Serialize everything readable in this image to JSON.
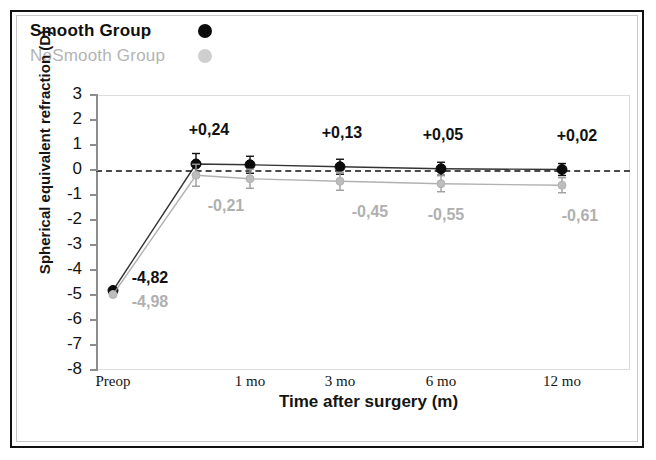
{
  "figure": {
    "legend": {
      "position": "top-left",
      "entries": [
        {
          "label": "Smooth Group",
          "marker": "filled-circle",
          "color": "#0b0b0b",
          "text_color": "#101010"
        },
        {
          "label": "NoSmooth Group",
          "marker": "filled-circle",
          "color": "#cecece",
          "text_color": "#b4b4b4"
        }
      ]
    }
  },
  "chart_data": {
    "type": "line",
    "title": "",
    "xlabel": "Time after surgery (m)",
    "ylabel": "Spherical equivalent refraction (D)",
    "categories": [
      "Preop",
      "",
      "1 mo",
      "3 mo",
      "6 mo",
      "12 mo"
    ],
    "tick_labels_x": [
      "Preop",
      "1 mo",
      "3 mo",
      "6 mo",
      "12 mo"
    ],
    "ylim": [
      -8,
      3
    ],
    "yticks": [
      3,
      2,
      1,
      0,
      -1,
      -2,
      -3,
      -4,
      -5,
      -6,
      -7,
      -8
    ],
    "ytick_labels": [
      "3",
      "2",
      "1",
      "0",
      "-1",
      "-2",
      "-3",
      "-4",
      "-5",
      "-6",
      "-7",
      "-8"
    ],
    "grid": false,
    "legend_position": "above-plot-left",
    "reference_line": {
      "y": 0,
      "style": "dashed",
      "color": "#4a4a4a"
    },
    "series": [
      {
        "name": "Smooth Group",
        "color": "#111111",
        "marker": "filled-circle",
        "values": [
          -4.82,
          0.24,
          0.21,
          0.13,
          0.05,
          0.02
        ],
        "errors": [
          0.0,
          0.42,
          0.34,
          0.3,
          0.26,
          0.24
        ],
        "point_labels": [
          "-4,82",
          "+0,24",
          "",
          "+0,13",
          "+0,05",
          "+0,02"
        ]
      },
      {
        "name": "NoSmooth Group",
        "color": "#9e9e9e",
        "marker": "filled-circle",
        "values": [
          -4.98,
          -0.21,
          -0.35,
          -0.45,
          -0.55,
          -0.61
        ],
        "errors": [
          0.0,
          0.44,
          0.38,
          0.36,
          0.32,
          0.3
        ],
        "point_labels": [
          "-4,98",
          "-0,21",
          "",
          "-0,45",
          "-0,55",
          "-0,61"
        ]
      }
    ],
    "annotations": [
      {
        "text": "+0,24",
        "series": "Smooth Group",
        "x_index": 1,
        "color": "#111111"
      },
      {
        "text": "+0,13",
        "series": "Smooth Group",
        "x_index": 3,
        "color": "#111111"
      },
      {
        "text": "+0,05",
        "series": "Smooth Group",
        "x_index": 4,
        "color": "#111111"
      },
      {
        "text": "+0,02",
        "series": "Smooth Group",
        "x_index": 5,
        "color": "#111111"
      },
      {
        "text": "-4,82",
        "series": "Smooth Group",
        "x_index": 0,
        "color": "#111111"
      },
      {
        "text": "-0,21",
        "series": "NoSmooth Group",
        "x_index": 1,
        "color": "#b0b0b0"
      },
      {
        "text": "-0,45",
        "series": "NoSmooth Group",
        "x_index": 3,
        "color": "#b0b0b0"
      },
      {
        "text": "-0,55",
        "series": "NoSmooth Group",
        "x_index": 4,
        "color": "#b0b0b0"
      },
      {
        "text": "-0,61",
        "series": "NoSmooth Group",
        "x_index": 5,
        "color": "#b0b0b0"
      },
      {
        "text": "-4,98",
        "series": "NoSmooth Group",
        "x_index": 0,
        "color": "#b0b0b0"
      }
    ]
  }
}
